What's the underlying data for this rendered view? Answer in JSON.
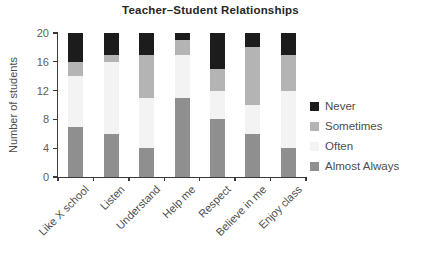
{
  "chart_data": {
    "type": "bar",
    "stacked": true,
    "title": "Teacher–Student Relationships",
    "ylabel": "Number of students",
    "xlabel": "",
    "categories": [
      "Like X school",
      "Listen",
      "Understand",
      "Help me",
      "Respect",
      "Believe in me",
      "Enjoy class"
    ],
    "series": [
      {
        "name": "Almost Always",
        "color": "#8f8f8f",
        "values": [
          7,
          6,
          4,
          11,
          8,
          6,
          4
        ]
      },
      {
        "name": "Often",
        "color": "#f3f3f3",
        "values": [
          7,
          10,
          7,
          6,
          4,
          4,
          8
        ]
      },
      {
        "name": "Sometimes",
        "color": "#b4b4b4",
        "values": [
          2,
          1,
          6,
          2,
          3,
          8,
          5
        ]
      },
      {
        "name": "Never",
        "color": "#1c1c1c",
        "values": [
          4,
          3,
          3,
          1,
          5,
          2,
          3
        ]
      }
    ],
    "legend_order": [
      "Never",
      "Sometimes",
      "Often",
      "Almost Always"
    ],
    "legend_position": "right",
    "ylim": [
      0,
      20
    ],
    "yticks": [
      0,
      4,
      8,
      12,
      16,
      20
    ],
    "grid": false,
    "totals_per_bar": 20
  }
}
